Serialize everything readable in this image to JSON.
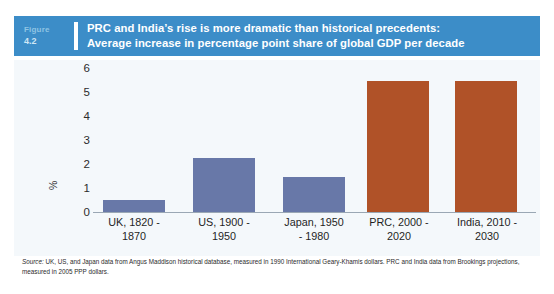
{
  "figure": {
    "label_word": "Figure",
    "number": "4.2",
    "title_line1": "PRC and India’s rise is more dramatic than historical precedents:",
    "title_line2": "Average increase in percentage point share of global GDP per decade",
    "header_color": "#3c8dc8"
  },
  "chart_data": {
    "type": "bar",
    "title": "PRC and India’s rise is more dramatic than historical precedents: Average increase in percentage point share of global GDP per decade",
    "categories": [
      "UK, 1820 - 1870",
      "US, 1900 - 1950",
      "Japan, 1950 - 1980",
      "PRC, 2000 - 2020",
      "India, 2010 - 2030"
    ],
    "category_lines": [
      [
        "UK, 1820 -",
        "1870"
      ],
      [
        "US, 1900 -",
        "1950"
      ],
      [
        "Japan, 1950",
        "- 1980"
      ],
      [
        "PRC, 2000 -",
        "2020"
      ],
      [
        "India, 2010 -",
        "2030"
      ]
    ],
    "values": [
      0.5,
      2.25,
      1.45,
      5.45,
      5.45
    ],
    "colors": [
      "#6878a8",
      "#6878a8",
      "#6878a8",
      "#b05228",
      "#b05228"
    ],
    "xlabel": "",
    "ylabel": "%",
    "ylim": [
      0,
      6
    ],
    "yticks": [
      0,
      1,
      2,
      3,
      4,
      5,
      6
    ],
    "ytick_labels": [
      "0",
      "1",
      "2",
      "3",
      "4",
      "5",
      "6"
    ],
    "grid": false,
    "legend": "none"
  },
  "source": {
    "prefix": "Source:",
    "text": " UK, US, and Japan data from Angus Maddison historical database, measured in 1990 International Geary-Khamis dollars. PRC and India data from Brookings projections, measured in 2005 PPP dollars."
  }
}
